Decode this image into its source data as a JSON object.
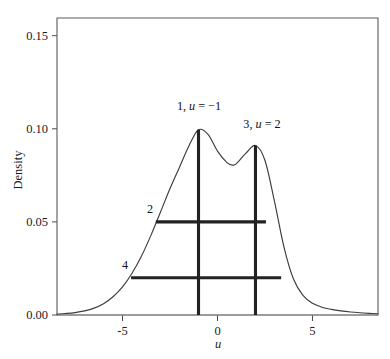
{
  "chart_data": {
    "type": "line",
    "title": "",
    "subtitle": "",
    "xlabel": "u",
    "ylabel": "Density",
    "xlim": [
      -8.45,
      8.45
    ],
    "ylim": [
      0.0,
      0.1595
    ],
    "grid": false,
    "legend": null,
    "x_ticks": [
      -5,
      0,
      5
    ],
    "x_tick_labels": [
      "-5",
      "0",
      "5"
    ],
    "y_ticks": [
      0.0,
      0.05,
      0.1,
      0.15
    ],
    "y_tick_labels": [
      "0.00",
      "0.05",
      "0.10",
      "0.15"
    ],
    "series": [
      {
        "name": "density",
        "description": "Bimodal mixture density; mode 1 at u = -1 with density 0.0995, mode 2 at u = 2 with density 0.0910, local minimum near u = 0.8 with density 0.0805",
        "x": [
          -8.45,
          -8.0,
          -7.5,
          -7.0,
          -6.5,
          -6.0,
          -5.5,
          -5.0,
          -4.5,
          -4.0,
          -3.5,
          -3.0,
          -2.5,
          -2.0,
          -1.5,
          -1.0,
          -0.5,
          0.0,
          0.5,
          0.8,
          1.0,
          1.5,
          2.0,
          2.5,
          3.0,
          3.5,
          4.0,
          4.5,
          5.0,
          5.5,
          6.0,
          6.5,
          7.0,
          7.5,
          8.0,
          8.45
        ],
        "y": [
          0.0005,
          0.0008,
          0.0013,
          0.0022,
          0.0037,
          0.0061,
          0.0098,
          0.0151,
          0.0224,
          0.0317,
          0.0429,
          0.0553,
          0.0679,
          0.0794,
          0.0909,
          0.0995,
          0.097,
          0.088,
          0.0818,
          0.0805,
          0.0813,
          0.0869,
          0.091,
          0.083,
          0.061,
          0.0365,
          0.0193,
          0.0105,
          0.0063,
          0.0042,
          0.003,
          0.0022,
          0.0016,
          0.0012,
          0.0009,
          0.0007
        ]
      }
    ],
    "annotations": [
      {
        "id": "1",
        "label_number": "1",
        "label_text": "1, u = −1",
        "label_prefix": "1, ",
        "label_var": "u",
        "label_suffix": " = −1",
        "type": "vertical-line",
        "x": -1,
        "y_from": 0.0,
        "y_to": 0.0995
      },
      {
        "id": "3",
        "label_number": "3",
        "label_text": "3, u = 2",
        "label_prefix": "3, ",
        "label_var": "u",
        "label_suffix": " = 2",
        "type": "vertical-line",
        "x": 2,
        "y_from": 0.0,
        "y_to": 0.091
      },
      {
        "id": "2",
        "label_number": "2",
        "label_text": "2",
        "type": "horizontal-line",
        "y": 0.05,
        "x_from": -3.25,
        "x_to": 2.55
      },
      {
        "id": "4",
        "label_number": "4",
        "label_text": "4",
        "type": "horizontal-line",
        "y": 0.02,
        "x_from": -4.55,
        "x_to": 3.35
      }
    ],
    "colors": {
      "curve": "#3d3d3d",
      "marker": "#222222",
      "frame": "#5a5a5a",
      "baseline": "#8c8c8c",
      "text": "#1a1a1a",
      "background": "#ffffff"
    }
  }
}
